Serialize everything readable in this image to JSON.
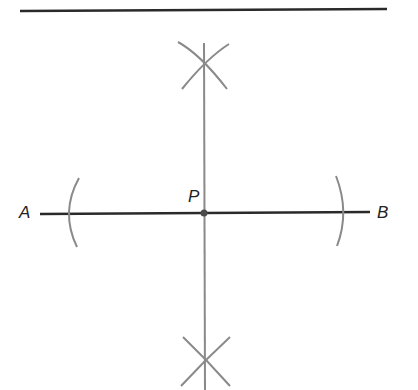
{
  "diagram": {
    "labels": {
      "a": "A",
      "b": "B",
      "p": "P"
    },
    "colors": {
      "line": "#2a2a2a",
      "construction": "#8a8a8a",
      "point": "#4a4a4a"
    }
  }
}
